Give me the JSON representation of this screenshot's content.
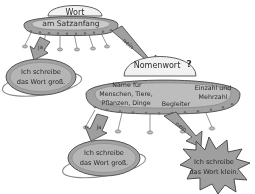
{
  "diagram": {
    "title_node": {
      "label": "Wort"
    },
    "decision_1": {
      "dome_label": "Wort",
      "body_label": "am Satzanfang",
      "yes_label": "ja",
      "no_label": "nein"
    },
    "decision_2": {
      "dome_label": "Nomenwort",
      "dome_marker": "?",
      "attributes": [
        "Name für",
        "Menschen, Tiere,",
        "Pflanzen, Dinge",
        "Begleiter",
        "Einzahl und",
        "Mehrzahl"
      ],
      "yes_label": "ja",
      "no_label": "nein"
    },
    "outcome_1": {
      "line1": "Ich schreibe",
      "line2": "das Wort groß."
    },
    "outcome_2": {
      "line1": "Ich schreibe",
      "line2": "das Wort groß."
    },
    "outcome_3": {
      "line1": "Ich schreibe",
      "line2": "das Wort klein."
    },
    "colors": {
      "fill_body": "#9e9e9e",
      "fill_dome": "#efefef",
      "fill_arrow": "#8f8f8f",
      "stroke": "#5a5a5a",
      "text": "#2b2b2b",
      "background": "#ffffff"
    }
  }
}
